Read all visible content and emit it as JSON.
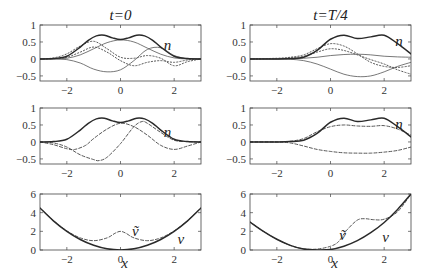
{
  "chart_data": [
    {
      "id": "p11",
      "type": "line",
      "title": "t=0",
      "row": 0,
      "col": 0,
      "xlim": [
        -3,
        3
      ],
      "ylim": [
        -0.65,
        1
      ],
      "xticks": [
        -2,
        0,
        2
      ],
      "yticks": [
        1,
        0.5,
        0,
        -0.5
      ],
      "ytick_labels": [
        "1",
        "0.5",
        "0",
        "−0.5"
      ],
      "xtick_labels": [
        "−2",
        "0",
        "2"
      ],
      "annotations": [
        {
          "text": "n",
          "x": 1.75,
          "y": 0.42
        }
      ],
      "series": [
        {
          "name": "n",
          "style": "solid-thick",
          "x": [
            -3,
            -2.5,
            -2,
            -1.5,
            -1.2,
            -0.9,
            -0.6,
            -0.3,
            0,
            0.3,
            0.6,
            0.9,
            1.2,
            1.5,
            2,
            2.5,
            3
          ],
          "y": [
            0,
            0.01,
            0.08,
            0.35,
            0.55,
            0.68,
            0.7,
            0.62,
            0.57,
            0.62,
            0.7,
            0.68,
            0.55,
            0.35,
            0.08,
            0.01,
            0
          ]
        },
        {
          "name": "component-1",
          "style": "solid-thin",
          "x": [
            -3,
            -2.5,
            -2,
            -1.5,
            -1,
            -0.5,
            0,
            0.5,
            1,
            1.5,
            2,
            2.5,
            3
          ],
          "y": [
            0,
            0,
            0.02,
            0.12,
            0.3,
            0.48,
            0.56,
            0.5,
            0.32,
            0.14,
            0.03,
            0,
            0
          ]
        },
        {
          "name": "component-2",
          "style": "solid-thin",
          "x": [
            -3,
            -2.5,
            -2,
            -1.5,
            -1,
            -0.5,
            0,
            0.5,
            1,
            1.5,
            2,
            2.5,
            3
          ],
          "y": [
            0,
            0,
            -0.02,
            -0.12,
            -0.3,
            -0.38,
            -0.32,
            -0.05,
            0.28,
            0.33,
            0.1,
            0.01,
            0
          ]
        },
        {
          "name": "component-3",
          "style": "dotted",
          "x": [
            -3,
            -2.5,
            -2,
            -1.5,
            -1,
            -0.5,
            0,
            0.5,
            1,
            1.5,
            2,
            2.5,
            3
          ],
          "y": [
            0,
            0.03,
            0.15,
            0.38,
            0.52,
            0.3,
            0.05,
            0.02,
            0.1,
            0.02,
            -0.2,
            -0.08,
            0
          ]
        },
        {
          "name": "component-4",
          "style": "dotted",
          "x": [
            -3,
            -2.5,
            -2,
            -1.5,
            -1,
            -0.5,
            0,
            0.5,
            1,
            1.5,
            2,
            2.5,
            3
          ],
          "y": [
            0,
            0.01,
            0.05,
            0.2,
            0.35,
            0.2,
            -0.05,
            -0.2,
            -0.1,
            -0.05,
            -0.1,
            -0.03,
            0
          ]
        }
      ]
    },
    {
      "id": "p12",
      "type": "line",
      "title": "t=T/4",
      "row": 0,
      "col": 1,
      "xlim": [
        -3,
        3
      ],
      "ylim": [
        -0.65,
        1
      ],
      "xticks": [
        -2,
        0,
        2
      ],
      "yticks": [
        1,
        0.5,
        0,
        -0.5
      ],
      "ytick_labels": [
        "1",
        "0.5",
        "0",
        "−0.5"
      ],
      "xtick_labels": [
        "−2",
        "0",
        "2"
      ],
      "annotations": [
        {
          "text": "n",
          "x": 2.55,
          "y": 0.52
        }
      ],
      "series": [
        {
          "name": "n",
          "style": "solid-thick",
          "x": [
            -3,
            -2,
            -1.5,
            -1,
            -0.5,
            0,
            0.5,
            1,
            1.5,
            2,
            2.5,
            3
          ],
          "y": [
            0,
            0,
            0.01,
            0.05,
            0.25,
            0.58,
            0.7,
            0.6,
            0.65,
            0.7,
            0.45,
            0.15
          ]
        },
        {
          "name": "component-1",
          "style": "solid-thin",
          "x": [
            -3,
            -2,
            -1.5,
            -1,
            -0.5,
            0,
            0.5,
            1,
            1.5,
            2,
            2.5,
            3
          ],
          "y": [
            0,
            0,
            0,
            0.02,
            0.05,
            0.1,
            0.13,
            0.14,
            0.12,
            0.08,
            0.06,
            0.05
          ]
        },
        {
          "name": "component-2",
          "style": "solid-thin",
          "x": [
            -3,
            -2,
            -1.5,
            -1,
            -0.5,
            0,
            0.5,
            1,
            1.5,
            2,
            2.5,
            3
          ],
          "y": [
            0,
            0,
            -0.01,
            -0.05,
            -0.15,
            -0.3,
            -0.45,
            -0.52,
            -0.5,
            -0.38,
            -0.22,
            -0.1
          ]
        },
        {
          "name": "component-3",
          "style": "dotted",
          "x": [
            -3,
            -2,
            -1.5,
            -1,
            -0.5,
            0,
            0.5,
            1,
            1.5,
            2,
            2.5,
            3
          ],
          "y": [
            0,
            0.02,
            0.05,
            0.12,
            0.3,
            0.45,
            0.38,
            0.15,
            -0.1,
            -0.22,
            -0.25,
            -0.2
          ]
        },
        {
          "name": "component-4",
          "style": "dotted",
          "x": [
            -3,
            -2,
            -1.5,
            -1,
            -0.5,
            0,
            0.5,
            1,
            1.5,
            2,
            2.5,
            3
          ],
          "y": [
            0,
            0.01,
            0.03,
            0.08,
            0.2,
            0.3,
            0.25,
            0.12,
            -0.02,
            -0.15,
            -0.32,
            -0.45
          ]
        }
      ]
    },
    {
      "id": "p21",
      "type": "line",
      "title": "",
      "row": 1,
      "col": 0,
      "xlim": [
        -3,
        3
      ],
      "ylim": [
        -0.65,
        1
      ],
      "xticks": [
        -2,
        0,
        2
      ],
      "yticks": [
        1,
        0.5,
        0,
        -0.5
      ],
      "ytick_labels": [
        "1",
        "0.5",
        "0",
        "−0.5"
      ],
      "xtick_labels": [
        "−2",
        "0",
        "2"
      ],
      "annotations": [
        {
          "text": "n",
          "x": 1.75,
          "y": 0.3
        }
      ],
      "series": [
        {
          "name": "n",
          "style": "solid-thick",
          "x": [
            -3,
            -2.5,
            -2,
            -1.5,
            -1.2,
            -0.9,
            -0.6,
            -0.3,
            0,
            0.3,
            0.6,
            0.9,
            1.2,
            1.5,
            2,
            2.5,
            3
          ],
          "y": [
            0,
            0.01,
            0.08,
            0.35,
            0.55,
            0.68,
            0.7,
            0.62,
            0.57,
            0.62,
            0.7,
            0.68,
            0.55,
            0.35,
            0.08,
            0.01,
            0
          ]
        },
        {
          "name": "component-a",
          "style": "dashed",
          "x": [
            -3,
            -2.5,
            -2,
            -1.7,
            -1.3,
            -1,
            -0.5,
            0,
            0.5,
            1,
            1.5,
            2,
            2.5,
            3
          ],
          "y": [
            0,
            -0.08,
            -0.2,
            -0.22,
            -0.1,
            0.1,
            0.38,
            0.55,
            0.45,
            0.2,
            -0.1,
            -0.22,
            -0.12,
            0
          ]
        },
        {
          "name": "component-b",
          "style": "dashed",
          "x": [
            -3,
            -2.5,
            -2,
            -1.5,
            -1,
            -0.8,
            -0.5,
            0,
            0.5,
            0.8,
            1,
            1.5,
            2,
            2.5,
            3
          ],
          "y": [
            0,
            -0.03,
            -0.15,
            -0.38,
            -0.52,
            -0.55,
            -0.45,
            -0.05,
            0.45,
            0.6,
            0.55,
            0.28,
            0.05,
            0.01,
            0
          ]
        }
      ]
    },
    {
      "id": "p22",
      "type": "line",
      "title": "",
      "row": 1,
      "col": 1,
      "xlim": [
        -3,
        3
      ],
      "ylim": [
        -0.65,
        1
      ],
      "xticks": [
        -2,
        0,
        2
      ],
      "yticks": [
        1,
        0.5,
        0,
        -0.5
      ],
      "ytick_labels": [
        "1",
        "0.5",
        "0",
        "−0.5"
      ],
      "xtick_labels": [
        "−2",
        "0",
        "2"
      ],
      "annotations": [
        {
          "text": "n",
          "x": 2.55,
          "y": 0.52
        }
      ],
      "series": [
        {
          "name": "n",
          "style": "solid-thick",
          "x": [
            -3,
            -2,
            -1.5,
            -1,
            -0.5,
            0,
            0.5,
            1,
            1.5,
            2,
            2.5,
            3
          ],
          "y": [
            0,
            0,
            0.01,
            0.05,
            0.25,
            0.58,
            0.7,
            0.6,
            0.65,
            0.7,
            0.45,
            0.15
          ]
        },
        {
          "name": "component-a",
          "style": "dashed",
          "x": [
            -3,
            -2,
            -1.5,
            -1,
            -0.5,
            0,
            0.5,
            1,
            1.5,
            2,
            2.5,
            3
          ],
          "y": [
            0,
            0,
            0.02,
            0.1,
            0.3,
            0.45,
            0.5,
            0.47,
            0.46,
            0.48,
            0.38,
            0.2
          ]
        },
        {
          "name": "component-b",
          "style": "dashed",
          "x": [
            -3,
            -2,
            -1.5,
            -1,
            -0.5,
            0,
            0.5,
            1,
            1.5,
            2,
            2.5,
            3
          ],
          "y": [
            0,
            0,
            -0.03,
            -0.12,
            -0.22,
            -0.28,
            -0.32,
            -0.33,
            -0.33,
            -0.3,
            -0.25,
            -0.15
          ]
        }
      ]
    },
    {
      "id": "p31",
      "type": "line",
      "title": "",
      "row": 2,
      "col": 0,
      "xlim": [
        -3,
        3
      ],
      "ylim": [
        0,
        6
      ],
      "xticks": [
        -2,
        0,
        2
      ],
      "yticks": [
        6,
        4,
        2,
        0
      ],
      "ytick_labels": [
        "6",
        "4",
        "2",
        "0"
      ],
      "xtick_labels": [
        "−2",
        "0",
        "2"
      ],
      "xlabel": "x",
      "annotations": [
        {
          "text": "ṽ",
          "x": 0.55,
          "y": 2.0
        },
        {
          "text": "v",
          "x": 2.25,
          "y": 1.2
        }
      ],
      "series": [
        {
          "name": "v",
          "style": "solid-thick",
          "x": [
            -3,
            -2.5,
            -2,
            -1.5,
            -1,
            -0.5,
            0,
            0.5,
            1,
            1.5,
            2,
            2.5,
            3
          ],
          "y": [
            4.5,
            3.125,
            2,
            1.125,
            0.5,
            0.125,
            0,
            0.125,
            0.5,
            1.125,
            2,
            3.125,
            4.5
          ]
        },
        {
          "name": "v-tilde",
          "style": "dashed",
          "x": [
            -3,
            -2.5,
            -2,
            -1.5,
            -1,
            -0.5,
            -0.2,
            0,
            0.2,
            0.5,
            1,
            1.5,
            2,
            2.5,
            3
          ],
          "y": [
            4.5,
            3.15,
            2.05,
            1.3,
            1.0,
            1.3,
            1.8,
            2.0,
            1.8,
            1.3,
            1.0,
            1.3,
            2.05,
            3.15,
            4.5
          ]
        }
      ]
    },
    {
      "id": "p32",
      "type": "line",
      "title": "",
      "row": 2,
      "col": 1,
      "xlim": [
        -3,
        3
      ],
      "ylim": [
        0,
        6
      ],
      "xticks": [
        -2,
        0,
        2
      ],
      "yticks": [
        6,
        4,
        2,
        0
      ],
      "ytick_labels": [
        "6",
        "4",
        "2",
        "0"
      ],
      "xtick_labels": [
        "−2",
        "0",
        "2"
      ],
      "xlabel": "x",
      "annotations": [
        {
          "text": "ṽ",
          "x": 0.45,
          "y": 1.6
        },
        {
          "text": "v",
          "x": 2.05,
          "y": 1.4
        }
      ],
      "series": [
        {
          "name": "v",
          "style": "solid-thick",
          "x": [
            -3,
            -2.5,
            -2,
            -1.5,
            -1,
            -0.5,
            0,
            0.5,
            1,
            1.5,
            2,
            2.5,
            3
          ],
          "y": [
            3.0,
            2.0,
            1.15,
            0.5,
            0.1,
            0.0,
            0.05,
            0.4,
            1.0,
            1.85,
            2.95,
            4.35,
            6.0
          ]
        },
        {
          "name": "v-tilde",
          "style": "dashed",
          "x": [
            -3,
            -2.5,
            -2,
            -1.5,
            -1,
            -0.5,
            0,
            0.3,
            0.6,
            1,
            1.3,
            1.6,
            2,
            2.5,
            3
          ],
          "y": [
            3.0,
            2.0,
            1.15,
            0.5,
            0.12,
            0.1,
            0.4,
            0.9,
            2.1,
            3.2,
            3.35,
            3.25,
            3.3,
            4.1,
            6.0
          ]
        }
      ]
    }
  ],
  "panels_layout": {
    "col_x": [
      40,
      250
    ],
    "row_y": [
      25,
      108,
      194
    ],
    "plot_width": 161,
    "plot_height": 56
  }
}
